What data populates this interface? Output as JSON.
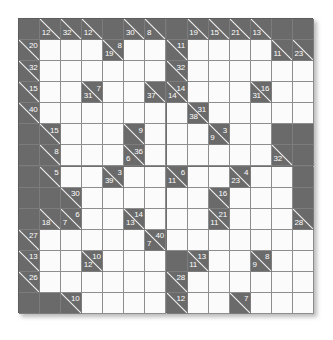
{
  "puzzle": {
    "type": "kakuro",
    "rows": 14,
    "cols": 14,
    "colors": {
      "block": "#6a6a6a",
      "open": "#fbfbfb",
      "grid_line": "#8d8d8d",
      "clue_text": "#fdfdfd",
      "slash": "#f2f2f2",
      "page_background": "#ffffff"
    },
    "cells": [
      [
        {
          "t": "block"
        },
        {
          "t": "clue",
          "down": "12"
        },
        {
          "t": "clue",
          "down": "32"
        },
        {
          "t": "clue",
          "down": "12"
        },
        {
          "t": "block"
        },
        {
          "t": "clue",
          "down": "30"
        },
        {
          "t": "clue",
          "down": "8"
        },
        {
          "t": "block"
        },
        {
          "t": "clue",
          "down": "19"
        },
        {
          "t": "clue",
          "down": "15"
        },
        {
          "t": "clue",
          "down": "21"
        },
        {
          "t": "clue",
          "down": "13"
        },
        {
          "t": "block"
        },
        {
          "t": "block"
        }
      ],
      [
        {
          "t": "clue",
          "right": "20"
        },
        {
          "t": "open"
        },
        {
          "t": "open"
        },
        {
          "t": "open"
        },
        {
          "t": "clue",
          "right": "8",
          "down": "19"
        },
        {
          "t": "open"
        },
        {
          "t": "open"
        },
        {
          "t": "clue",
          "right": "11"
        },
        {
          "t": "open"
        },
        {
          "t": "open"
        },
        {
          "t": "open"
        },
        {
          "t": "open"
        },
        {
          "t": "clue",
          "down": "11"
        },
        {
          "t": "clue",
          "down": "23"
        }
      ],
      [
        {
          "t": "clue",
          "right": "32"
        },
        {
          "t": "open"
        },
        {
          "t": "open"
        },
        {
          "t": "open"
        },
        {
          "t": "open"
        },
        {
          "t": "open"
        },
        {
          "t": "open"
        },
        {
          "t": "clue",
          "right": "32"
        },
        {
          "t": "open"
        },
        {
          "t": "open"
        },
        {
          "t": "open"
        },
        {
          "t": "open"
        },
        {
          "t": "open"
        },
        {
          "t": "open"
        }
      ],
      [
        {
          "t": "clue",
          "right": "15"
        },
        {
          "t": "open"
        },
        {
          "t": "open"
        },
        {
          "t": "clue",
          "right": "7",
          "down": "31"
        },
        {
          "t": "open"
        },
        {
          "t": "open"
        },
        {
          "t": "clue",
          "down": "37"
        },
        {
          "t": "clue",
          "right": "14",
          "down": "14"
        },
        {
          "t": "open"
        },
        {
          "t": "open"
        },
        {
          "t": "open"
        },
        {
          "t": "clue",
          "right": "16",
          "down": "31"
        },
        {
          "t": "open"
        },
        {
          "t": "open"
        }
      ],
      [
        {
          "t": "clue",
          "right": "40"
        },
        {
          "t": "open"
        },
        {
          "t": "open"
        },
        {
          "t": "open"
        },
        {
          "t": "open"
        },
        {
          "t": "open"
        },
        {
          "t": "open"
        },
        {
          "t": "open"
        },
        {
          "t": "clue",
          "right": "31",
          "down": "38"
        },
        {
          "t": "open"
        },
        {
          "t": "open"
        },
        {
          "t": "open"
        },
        {
          "t": "open"
        },
        {
          "t": "open"
        }
      ],
      [
        {
          "t": "block"
        },
        {
          "t": "clue",
          "right": "15"
        },
        {
          "t": "open"
        },
        {
          "t": "open"
        },
        {
          "t": "open"
        },
        {
          "t": "clue",
          "right": "9"
        },
        {
          "t": "open"
        },
        {
          "t": "open"
        },
        {
          "t": "open"
        },
        {
          "t": "clue",
          "right": "3",
          "down": "9"
        },
        {
          "t": "open"
        },
        {
          "t": "open"
        },
        {
          "t": "block"
        },
        {
          "t": "block"
        }
      ],
      [
        {
          "t": "block"
        },
        {
          "t": "clue",
          "right": "8"
        },
        {
          "t": "open"
        },
        {
          "t": "open"
        },
        {
          "t": "open"
        },
        {
          "t": "clue",
          "right": "36",
          "down": "6"
        },
        {
          "t": "open"
        },
        {
          "t": "open"
        },
        {
          "t": "open"
        },
        {
          "t": "open"
        },
        {
          "t": "open"
        },
        {
          "t": "open"
        },
        {
          "t": "clue",
          "down": "32"
        },
        {
          "t": "block"
        }
      ],
      [
        {
          "t": "block"
        },
        {
          "t": "clue",
          "right": "5"
        },
        {
          "t": "open"
        },
        {
          "t": "open"
        },
        {
          "t": "clue",
          "right": "3",
          "down": "39"
        },
        {
          "t": "open"
        },
        {
          "t": "open"
        },
        {
          "t": "clue",
          "right": "6",
          "down": "11"
        },
        {
          "t": "open"
        },
        {
          "t": "open"
        },
        {
          "t": "clue",
          "right": "4",
          "down": "23"
        },
        {
          "t": "open"
        },
        {
          "t": "open"
        },
        {
          "t": "block"
        }
      ],
      [
        {
          "t": "block"
        },
        {
          "t": "block"
        },
        {
          "t": "clue",
          "right": "30"
        },
        {
          "t": "open"
        },
        {
          "t": "open"
        },
        {
          "t": "open"
        },
        {
          "t": "open"
        },
        {
          "t": "open"
        },
        {
          "t": "open"
        },
        {
          "t": "clue",
          "right": "16"
        },
        {
          "t": "open"
        },
        {
          "t": "open"
        },
        {
          "t": "open"
        },
        {
          "t": "block"
        }
      ],
      [
        {
          "t": "block"
        },
        {
          "t": "clue",
          "down": "18"
        },
        {
          "t": "clue",
          "right": "6",
          "down": "7"
        },
        {
          "t": "open"
        },
        {
          "t": "open"
        },
        {
          "t": "clue",
          "right": "14",
          "down": "13"
        },
        {
          "t": "open"
        },
        {
          "t": "open"
        },
        {
          "t": "open"
        },
        {
          "t": "clue",
          "right": "21",
          "down": "11"
        },
        {
          "t": "open"
        },
        {
          "t": "open"
        },
        {
          "t": "open"
        },
        {
          "t": "clue",
          "down": "28"
        }
      ],
      [
        {
          "t": "clue",
          "right": "27"
        },
        {
          "t": "open"
        },
        {
          "t": "open"
        },
        {
          "t": "open"
        },
        {
          "t": "open"
        },
        {
          "t": "open"
        },
        {
          "t": "clue",
          "right": "40",
          "down": "7"
        },
        {
          "t": "open"
        },
        {
          "t": "open"
        },
        {
          "t": "open"
        },
        {
          "t": "open"
        },
        {
          "t": "open"
        },
        {
          "t": "open"
        },
        {
          "t": "open"
        }
      ],
      [
        {
          "t": "clue",
          "right": "13"
        },
        {
          "t": "open"
        },
        {
          "t": "open"
        },
        {
          "t": "clue",
          "right": "10",
          "down": "12"
        },
        {
          "t": "open"
        },
        {
          "t": "open"
        },
        {
          "t": "open"
        },
        {
          "t": "block"
        },
        {
          "t": "clue",
          "right": "13",
          "down": "11"
        },
        {
          "t": "open"
        },
        {
          "t": "open"
        },
        {
          "t": "clue",
          "right": "8",
          "down": "9"
        },
        {
          "t": "open"
        },
        {
          "t": "open"
        }
      ],
      [
        {
          "t": "clue",
          "right": "26"
        },
        {
          "t": "open"
        },
        {
          "t": "open"
        },
        {
          "t": "open"
        },
        {
          "t": "open"
        },
        {
          "t": "open"
        },
        {
          "t": "open"
        },
        {
          "t": "clue",
          "right": "28"
        },
        {
          "t": "open"
        },
        {
          "t": "open"
        },
        {
          "t": "open"
        },
        {
          "t": "open"
        },
        {
          "t": "open"
        },
        {
          "t": "open"
        }
      ],
      [
        {
          "t": "block"
        },
        {
          "t": "block"
        },
        {
          "t": "clue",
          "right": "10"
        },
        {
          "t": "open"
        },
        {
          "t": "open"
        },
        {
          "t": "open"
        },
        {
          "t": "open"
        },
        {
          "t": "clue",
          "right": "12"
        },
        {
          "t": "open"
        },
        {
          "t": "open"
        },
        {
          "t": "clue",
          "right": "7"
        },
        {
          "t": "open"
        },
        {
          "t": "open"
        },
        {
          "t": "open"
        }
      ]
    ]
  }
}
